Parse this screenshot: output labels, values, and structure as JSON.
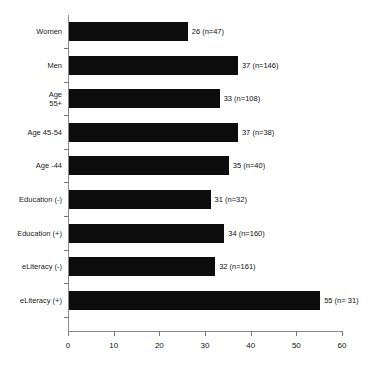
{
  "chart_data": {
    "type": "bar",
    "orientation": "horizontal",
    "title": "",
    "subtitle": "",
    "xlabel": "",
    "ylabel": "",
    "xlim": [
      0,
      60
    ],
    "xticks": [
      0,
      10,
      20,
      30,
      40,
      50,
      60
    ],
    "grid": false,
    "legend": null,
    "bar_color": "#0d0d0d",
    "axis_color": "#8a8a8a",
    "categories": [
      "Women",
      "Men",
      "Age\n55+",
      "Age 45-54",
      "Age -44",
      "Education (-)",
      "Education (+)",
      "eLiteracy (-)",
      "eLiteracy (+)"
    ],
    "values": [
      26,
      37,
      33,
      37,
      35,
      31,
      34,
      32,
      55
    ],
    "sample_sizes": [
      47,
      146,
      108,
      38,
      40,
      32,
      160,
      161,
      31
    ],
    "data_labels": [
      "26 (n=47)",
      "37 (n=146)",
      "33 (n=108)",
      "37 (n=38)",
      "35 (n=40)",
      "31 (n=32)",
      "34 (n=160)",
      "32 (n=161)",
      "55 (n= 31)"
    ]
  }
}
